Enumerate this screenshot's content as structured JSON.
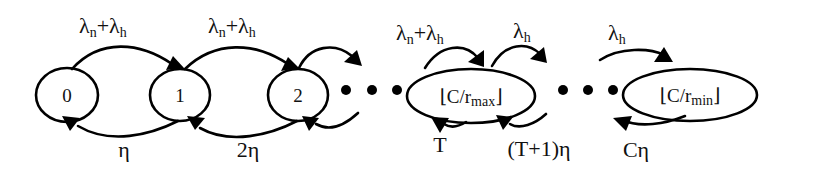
{
  "diagram": {
    "type": "markov-chain-state-transition",
    "nodes": [
      {
        "id": "s0",
        "label": "0"
      },
      {
        "id": "s1",
        "label": "1"
      },
      {
        "id": "s2",
        "label": "2"
      },
      {
        "id": "smax",
        "label_prefix": "⌊C/r",
        "label_sub": "max",
        "label_suffix": "⌋"
      },
      {
        "id": "smin",
        "label_prefix": "⌊C/r",
        "label_sub": "min",
        "label_suffix": "⌋"
      }
    ],
    "ellipsis": "• • •",
    "forward_labels": [
      {
        "from": "0",
        "to": "1",
        "base1": "λ",
        "sub1": "n",
        "plus": "+",
        "base2": "λ",
        "sub2": "h"
      },
      {
        "from": "1",
        "to": "2",
        "base1": "λ",
        "sub1": "n",
        "plus": "+",
        "base2": "λ",
        "sub2": "h"
      },
      {
        "from": "…",
        "to": "⌊C/r_max⌋",
        "base1": "λ",
        "sub1": "n",
        "plus": "+",
        "base2": "λ",
        "sub2": "h"
      },
      {
        "from": "⌊C/r_max⌋",
        "to": "…",
        "base": "λ",
        "sub": "h"
      },
      {
        "from": "…",
        "to": "⌊C/r_min⌋",
        "base": "λ",
        "sub": "h"
      }
    ],
    "backward_labels": [
      {
        "from": "1",
        "to": "0",
        "text": "η"
      },
      {
        "from": "2",
        "to": "1",
        "text": "2η"
      },
      {
        "from": "⌊C/r_max⌋",
        "to": "…",
        "text": "T"
      },
      {
        "from": "…",
        "to": "⌊C/r_max⌋",
        "text": "(T+1)η"
      },
      {
        "from": "⌊C/r_min⌋",
        "to": "…",
        "text": "Cη"
      }
    ],
    "colors": {
      "stroke": "#000000",
      "background": "#ffffff"
    }
  }
}
